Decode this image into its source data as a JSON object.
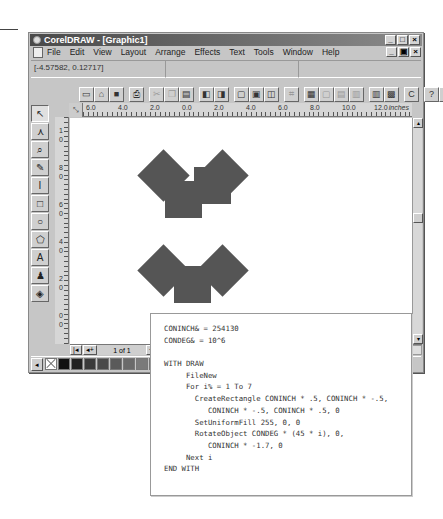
{
  "window": {
    "title": "CorelDRAW - [Graphic1]",
    "controls": [
      "_",
      "□",
      "×"
    ],
    "doc_controls": [
      "_",
      "▣",
      "×"
    ]
  },
  "menu": {
    "items": [
      {
        "label": "File"
      },
      {
        "label": "Edit"
      },
      {
        "label": "View"
      },
      {
        "label": "Layout"
      },
      {
        "label": "Arrange"
      },
      {
        "label": "Effects"
      },
      {
        "label": "Text"
      },
      {
        "label": "Tools"
      },
      {
        "label": "Window"
      },
      {
        "label": "Help"
      }
    ]
  },
  "status": {
    "coordinates": "[-4.57582, 0.12717]",
    "cell2": "",
    "cell3": ""
  },
  "toolbar": {
    "groups": [
      [
        {
          "icon": "new-icon",
          "glyph": "▭"
        },
        {
          "icon": "open-icon",
          "glyph": "⌂"
        },
        {
          "icon": "save-icon",
          "glyph": "■"
        }
      ],
      [
        {
          "icon": "print-icon",
          "glyph": "⎙"
        }
      ],
      [
        {
          "icon": "cut-icon",
          "glyph": "✂",
          "dim": true
        },
        {
          "icon": "copy-icon",
          "glyph": "❐",
          "dim": true
        },
        {
          "icon": "paste-icon",
          "glyph": "▤"
        }
      ],
      [
        {
          "icon": "import-icon",
          "glyph": "◧"
        },
        {
          "icon": "export-icon",
          "glyph": "◨"
        }
      ],
      [
        {
          "icon": "full-screen-preview-icon",
          "glyph": "▢"
        },
        {
          "icon": "wireframe-icon",
          "glyph": "▣"
        },
        {
          "icon": "snap-icon",
          "glyph": "◫"
        }
      ],
      [
        {
          "icon": "snap-grid-icon",
          "glyph": "⌗",
          "dim": true
        }
      ],
      [
        {
          "icon": "group-icon",
          "glyph": "▦"
        },
        {
          "icon": "ungroup-icon",
          "glyph": "▢",
          "dim": true
        },
        {
          "icon": "combine-icon",
          "glyph": "▤",
          "dim": true
        },
        {
          "icon": "break-apart-icon",
          "glyph": "▥",
          "dim": true
        }
      ],
      [
        {
          "icon": "roll-up-icon",
          "glyph": "▥"
        },
        {
          "icon": "properties-icon",
          "glyph": "▩"
        }
      ],
      [
        {
          "icon": "corel-apps-icon",
          "glyph": "C"
        }
      ],
      [
        {
          "icon": "context-help-icon",
          "glyph": "?"
        },
        {
          "icon": "tutor-icon",
          "glyph": "●"
        }
      ]
    ]
  },
  "toolbox": {
    "tools": [
      {
        "name": "pick-tool",
        "glyph": "↖",
        "active": true
      },
      {
        "name": "shape-tool",
        "glyph": "⋏"
      },
      {
        "name": "zoom-tool",
        "glyph": "⌕"
      },
      {
        "name": "pencil-tool",
        "glyph": "✎"
      },
      {
        "name": "dimension-tool",
        "glyph": "I"
      },
      {
        "name": "rectangle-tool",
        "glyph": "□"
      },
      {
        "name": "ellipse-tool",
        "glyph": "○"
      },
      {
        "name": "polygon-tool",
        "glyph": "⬠"
      },
      {
        "name": "text-tool",
        "glyph": "A"
      },
      {
        "name": "outline-tool",
        "glyph": "♟"
      },
      {
        "name": "fill-tool",
        "glyph": "◈"
      }
    ]
  },
  "rulers": {
    "corner": "⤡",
    "units": "inches",
    "horizontal": [
      "6.0",
      "4.0",
      "2.0",
      "0.0",
      "2.0",
      "4.0",
      "6.0",
      "8.0",
      "10.0",
      "12.0"
    ],
    "vertical": [
      "1",
      "0",
      "8",
      "0",
      "6",
      "0",
      "4",
      "0",
      "2",
      "0",
      "0",
      "0"
    ]
  },
  "canvas": {
    "shape_color": "#555555",
    "shapes": [
      {
        "x": 95,
        "y": 63,
        "rotated": false
      },
      {
        "x": 124,
        "y": 49,
        "rotated": false,
        "top": true
      },
      {
        "x": 75,
        "y": 39,
        "rotated": true
      },
      {
        "x": 134,
        "y": 39,
        "rotated": true
      },
      {
        "x": 75,
        "y": 134,
        "rotated": true
      },
      {
        "x": 134,
        "y": 134,
        "rotated": true
      },
      {
        "x": 104,
        "y": 148,
        "rotated": false
      }
    ]
  },
  "pagenav": {
    "first": "|◂",
    "prev": "◂+",
    "label": "1 of 1",
    "next": "+▸",
    "last": "▸|"
  },
  "palette": {
    "left_arrow": "◂",
    "right_arrow": "▸",
    "swatches": [
      "none",
      "#111111",
      "#222222",
      "#3a3a3a",
      "#4a4a4a",
      "#5a5a5a",
      "#6a6a6a",
      "#7a7a7a",
      "#8a8a8a",
      "#9a9a9a",
      "#aaaaaa",
      "#bababa",
      "#cacaca",
      "#dadada",
      "#eaeaea",
      "#f5f5f5",
      "#ffffff"
    ]
  },
  "code": {
    "lines": [
      "CONINCH& = 254130",
      "CONDEG& = 10^6",
      "",
      "WITH DRAW",
      "     FileNew",
      "     For i% = 1 To 7",
      "       CreateRectangle CONINCH * .5, CONINCH * -.5,",
      "          CONINCH * -.5, CONINCH * .5, 0",
      "       SetUniformFill 255, 0, 0",
      "       RotateObject CONDEG * (45 * i), 0,",
      "          CONINCH * -1.7, 0",
      "     Next i",
      "END WITH"
    ]
  }
}
